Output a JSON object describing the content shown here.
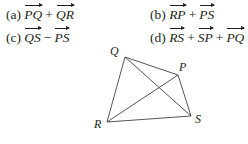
{
  "problems": [
    {
      "label": "(a)",
      "terms": [
        "PQ",
        "QR"
      ],
      "ops": [
        "+"
      ]
    },
    {
      "label": "(b)",
      "terms": [
        "RP",
        "PS"
      ],
      "ops": [
        "+"
      ]
    },
    {
      "label": "(c)",
      "terms": [
        "QS",
        "PS"
      ],
      "ops": [
        "−"
      ]
    },
    {
      "label": "(d)",
      "terms": [
        "RS",
        "SP",
        "PQ"
      ],
      "ops": [
        "+",
        "+"
      ]
    }
  ],
  "figure": {
    "vertices": {
      "Q": {
        "label": "Q",
        "x": 125,
        "y": 57
      },
      "P": {
        "label": "P",
        "x": 178,
        "y": 75
      },
      "S": {
        "label": "S",
        "x": 191,
        "y": 116
      },
      "R": {
        "label": "R",
        "x": 107,
        "y": 122
      }
    },
    "edges": [
      [
        "Q",
        "P"
      ],
      [
        "P",
        "S"
      ],
      [
        "S",
        "R"
      ],
      [
        "R",
        "Q"
      ],
      [
        "Q",
        "S"
      ],
      [
        "R",
        "P"
      ]
    ],
    "line_color": "#555555"
  }
}
